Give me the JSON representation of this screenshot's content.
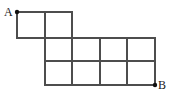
{
  "figure": {
    "type": "lattice-path-grid",
    "labels": {
      "start": "A",
      "end": "B"
    },
    "colors": {
      "background": "#ffffff",
      "grid_line": "#4d4d4d",
      "point": "#111111",
      "label_text": "#1a1a1a"
    },
    "geometry": {
      "cell_width": 27.5,
      "cell_height": 23.5,
      "x_ticks": [
        17,
        45,
        72,
        100,
        127,
        155
      ],
      "y_ticks": [
        12,
        38,
        61,
        85
      ],
      "line_width": 1.4,
      "point_radius": 2.2
    },
    "points": [
      {
        "name": "A",
        "x": 17,
        "y": 12
      },
      {
        "name": "B",
        "x": 155,
        "y": 85
      }
    ],
    "horizontal_segments": [
      {
        "y": 12,
        "x1": 17,
        "x2": 72
      },
      {
        "y": 38,
        "x1": 17,
        "x2": 155
      },
      {
        "y": 61,
        "x1": 45,
        "x2": 155
      },
      {
        "y": 85,
        "x1": 45,
        "x2": 155
      }
    ],
    "vertical_segments": [
      {
        "x": 17,
        "y1": 12,
        "y2": 38
      },
      {
        "x": 45,
        "y1": 12,
        "y2": 85
      },
      {
        "x": 72,
        "y1": 12,
        "y2": 85
      },
      {
        "x": 100,
        "y1": 38,
        "y2": 85
      },
      {
        "x": 127,
        "y1": 38,
        "y2": 85
      },
      {
        "x": 155,
        "y1": 38,
        "y2": 85
      }
    ],
    "rows": [
      {
        "row": "top",
        "cells": 2,
        "span_x": [
          17,
          72
        ],
        "span_y": [
          12,
          38
        ]
      },
      {
        "row": "middle",
        "cells": 4,
        "span_x": [
          45,
          155
        ],
        "span_y": [
          38,
          61
        ]
      },
      {
        "row": "bottom",
        "cells": 4,
        "span_x": [
          45,
          155
        ],
        "span_y": [
          61,
          85
        ]
      }
    ],
    "total_cells": 10
  }
}
